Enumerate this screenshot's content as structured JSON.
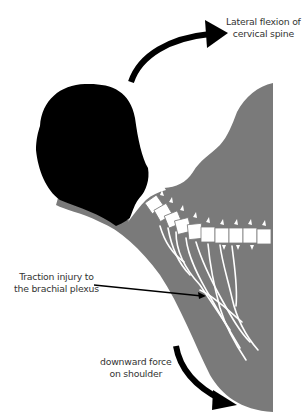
{
  "diagram": {
    "colors": {
      "background": "#ffffff",
      "torso": "#7a7a7a",
      "head": "#000000",
      "spine": "#ffffff",
      "nerves": "#ffffff",
      "arrow": "#000000",
      "text": "#333333"
    },
    "labels": {
      "lateral_flexion": {
        "line1": "Lateral flexion of",
        "line2": "cervical spine"
      },
      "traction_injury": {
        "line1": "Traction injury to",
        "line2": "the brachial plexus"
      },
      "downward_force": {
        "line1": "downward force",
        "line2": "on shoulder"
      }
    },
    "elements": {
      "head": "head-silhouette",
      "torso": "neck-shoulder-silhouette",
      "spine": "cervical-spine",
      "plexus": "brachial-plexus-nerves",
      "arrow_up": "curved-arrow-lateral-flexion",
      "arrow_down": "curved-arrow-downward-force",
      "leader_line": "leader-line-to-plexus"
    }
  }
}
